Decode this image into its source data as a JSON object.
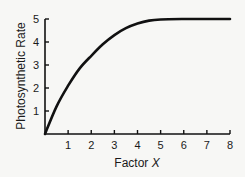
{
  "chart_data": {
    "type": "line",
    "title": "",
    "xlabel": "Factor X",
    "xlabel_prefix": "Factor ",
    "xlabel_var": "X",
    "ylabel": "Photosynthetic Rate",
    "xlim": [
      0,
      8
    ],
    "ylim": [
      0,
      5
    ],
    "x_ticks": [
      1,
      2,
      3,
      4,
      5,
      6,
      7,
      8
    ],
    "y_ticks": [
      1,
      2,
      3,
      4,
      5
    ],
    "grid": false,
    "legend": null,
    "series": [
      {
        "name": "Photosynthetic Rate",
        "x": [
          0,
          0.5,
          1,
          1.5,
          2,
          2.5,
          3,
          3.5,
          4,
          4.5,
          5,
          6,
          7,
          8
        ],
        "values": [
          0,
          1.2,
          2.1,
          2.85,
          3.4,
          3.9,
          4.3,
          4.6,
          4.8,
          4.93,
          4.98,
          5.0,
          5.0,
          5.0
        ]
      }
    ]
  }
}
